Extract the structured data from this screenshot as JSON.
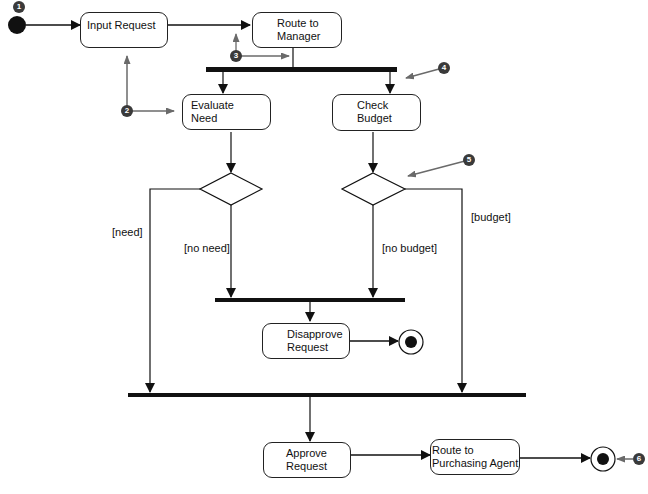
{
  "diagram": {
    "type": "UML activity diagram",
    "activities": [
      {
        "id": "input",
        "label": "Input Request"
      },
      {
        "id": "route_mgr",
        "label": "Route to\nManager"
      },
      {
        "id": "evaluate",
        "label": "Evaluate\nNeed"
      },
      {
        "id": "check",
        "label": "Check\nBudget"
      },
      {
        "id": "disapprove",
        "label": "Disapprove\nRequest"
      },
      {
        "id": "approve",
        "label": "Approve\nRequest"
      },
      {
        "id": "route_pa",
        "label": "Route to\nPurchasing Agent"
      }
    ],
    "guards": {
      "need": "[need]",
      "no_need": "[no need]",
      "no_budget": "[no budget]",
      "budget": "[budget]"
    },
    "callouts": [
      "1",
      "2",
      "3",
      "4",
      "5",
      "6"
    ],
    "colors": {
      "line": "#111111",
      "callout": "#3a3a3a",
      "callout_arrow": "#6a6a6a",
      "background": "#ffffff"
    }
  }
}
